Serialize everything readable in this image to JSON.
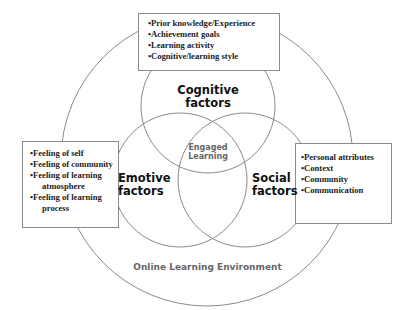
{
  "diagram": {
    "type": "venn-in-circle",
    "outer_circle": {
      "label": "Online Learning Environment",
      "color": "#666666"
    },
    "center": {
      "label_line1": "Engaged",
      "label_line2": "Learning",
      "color": "#666666"
    },
    "circles": [
      {
        "id": "cognitive",
        "label_line1": "Cognitive",
        "label_line2": "factors",
        "items": [
          "•Prior knowledge/Experience",
          "•Achievement goals",
          "•Learning activity",
          "•Cognitive/learning style"
        ]
      },
      {
        "id": "emotive",
        "label_line1": "Emotive",
        "label_line2": "factors",
        "items": [
          "•Feeling of self",
          "•Feeling of community",
          "•Feeling of learning",
          "atmosphere",
          "•Feeling of  learning",
          "process"
        ]
      },
      {
        "id": "social",
        "label_line1": "Social",
        "label_line2": "factors",
        "items": [
          "•Personal attributes",
          "•Context",
          "•Community",
          "•Communication"
        ]
      }
    ],
    "line_color": "#888888"
  }
}
